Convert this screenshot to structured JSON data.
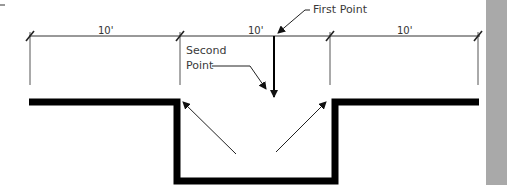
{
  "diagram": {
    "dimensions": [
      {
        "label": "10'",
        "segment": "left"
      },
      {
        "label": "10'",
        "segment": "middle"
      },
      {
        "label": "10'",
        "segment": "right"
      }
    ],
    "callouts": {
      "first_point": "First Point",
      "second_point_line1": "Second",
      "second_point_line2": "Point"
    },
    "colors": {
      "wall": "#000000",
      "dimension_line": "#333333",
      "side_bar": "#a9a9a9"
    }
  }
}
